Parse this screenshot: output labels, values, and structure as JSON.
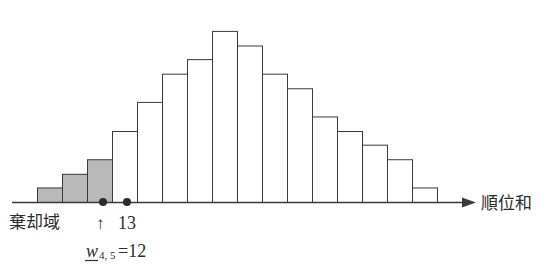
{
  "figure": {
    "title": "",
    "axis_label_x": "順位和",
    "arrow_glyph": "→"
  },
  "annotations": {
    "rejection_region_label": "棄却域",
    "up_arrow": "↑",
    "critical_value_label": "13",
    "formula_symbol": "w",
    "formula_subscript": "4, 5",
    "formula_equals_value": "=12"
  },
  "colors": {
    "stroke": "#3a3a3a",
    "shaded_fill": "#b9b9b9",
    "unshaded_fill": "#ffffff",
    "text": "#2b2b2b",
    "axis": "#3a3a3a"
  },
  "chart_data": {
    "type": "bar",
    "title": "",
    "xlabel": "順位和",
    "ylabel": "",
    "grid": false,
    "legend": null,
    "axis_arrow": true,
    "baseline_y_px": 202,
    "bar_width_px": 25,
    "first_bar_left_px": 37,
    "categories": [
      "10",
      "11",
      "12",
      "13",
      "14",
      "15",
      "16",
      "17",
      "18",
      "19",
      "20",
      "21",
      "22",
      "23",
      "24",
      "25"
    ],
    "values": [
      16,
      31,
      47,
      78,
      110,
      141,
      157,
      188,
      172,
      141,
      125,
      94,
      78,
      63,
      47,
      16
    ],
    "ylim": [
      0,
      200
    ],
    "shaded_indices": [
      0,
      1,
      2
    ],
    "shaded_meaning": "棄却域",
    "markers": [
      {
        "name": "w-lower-bound",
        "category": "12",
        "x_px": 103,
        "label": "w4,5=12"
      },
      {
        "name": "critical-13",
        "category": "13",
        "x_px": 127,
        "label": "13"
      }
    ]
  }
}
